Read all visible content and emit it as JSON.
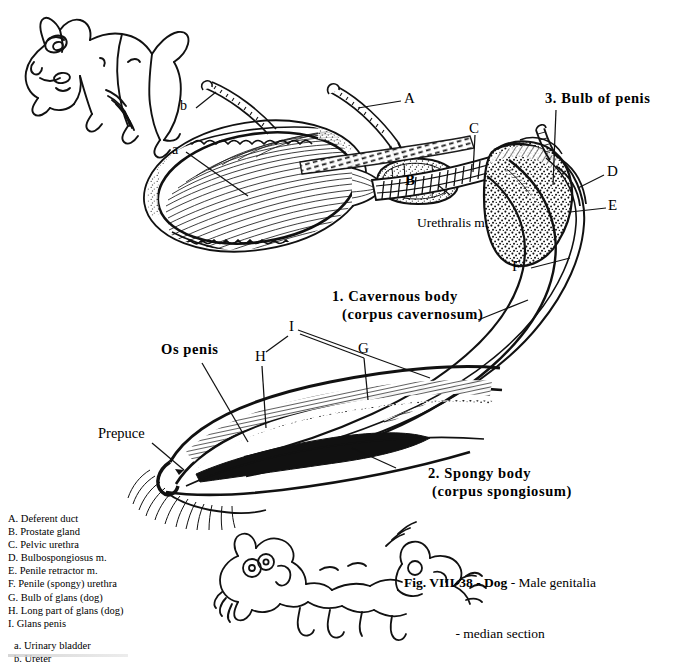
{
  "figure": {
    "caption_line1": "Fig. VIII-38 - Dog - Male genitalia",
    "caption_line2": "- median section",
    "caption_bold_part": "Fig. VIII-38 - Dog",
    "caption_rest": " - Male genitalia"
  },
  "numbered_labels": [
    {
      "id": "n1",
      "line1": "1. Cavernous body",
      "line2": "(corpus cavernosum)"
    },
    {
      "id": "n2",
      "line1": "2. Spongy body",
      "line2": "(corpus spongiosum)"
    },
    {
      "id": "n3",
      "line1": "3. Bulb of penis",
      "line2": ""
    }
  ],
  "named_labels": [
    {
      "id": "os-penis",
      "text": "Os penis"
    },
    {
      "id": "prepuce",
      "text": "Prepuce"
    },
    {
      "id": "urethralis",
      "text": "Urethralis m."
    }
  ],
  "letter_labels": [
    {
      "id": "A",
      "text": "A"
    },
    {
      "id": "B",
      "text": "B"
    },
    {
      "id": "C",
      "text": "C"
    },
    {
      "id": "D",
      "text": "D"
    },
    {
      "id": "E",
      "text": "E"
    },
    {
      "id": "F",
      "text": "F"
    },
    {
      "id": "G",
      "text": "G"
    },
    {
      "id": "H",
      "text": "H"
    },
    {
      "id": "I",
      "text": "I"
    },
    {
      "id": "a",
      "text": "a"
    },
    {
      "id": "b",
      "text": "b"
    }
  ],
  "legend": {
    "uppercase": [
      "A. Deferent duct",
      "B. Prostate gland",
      "C. Pelvic urethra",
      "D. Bulbospongiosus m.",
      "E. Penile retractor m.",
      "F. Penile (spongy) urethra",
      "G. Bulb of glans (dog)",
      "H. Long part of glans (dog)",
      "I. Glans penis"
    ],
    "lowercase": [
      "a. Urinary bladder",
      "b. Ureter"
    ]
  },
  "illustrations": [
    {
      "id": "cartoon-dog-standing",
      "name": "cartoon-dog-standing"
    },
    {
      "id": "cartoon-dogs-mating",
      "name": "cartoon-dogs-playing"
    },
    {
      "id": "anatomical-median-section",
      "name": "median-section-drawing"
    }
  ],
  "colors": {
    "ink": "#000000",
    "paper": "#ffffff"
  }
}
